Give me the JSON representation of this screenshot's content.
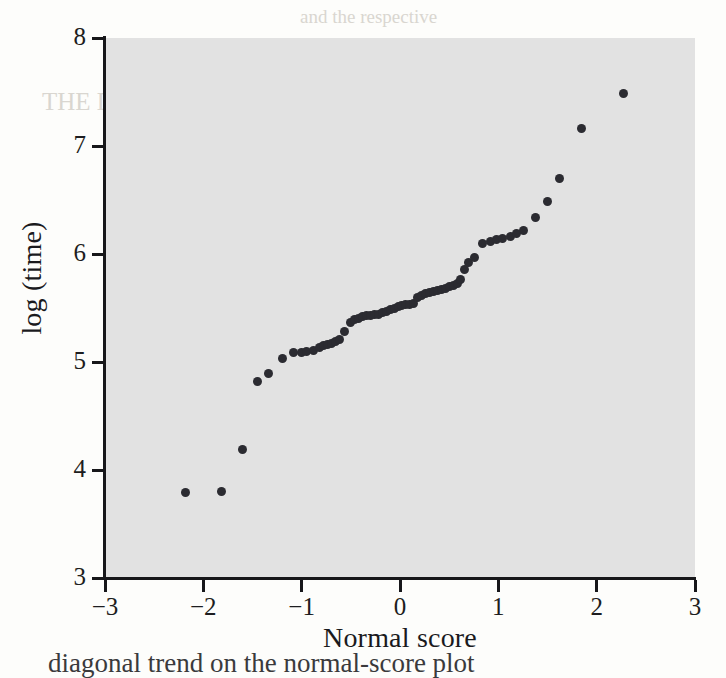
{
  "figure": {
    "xlabel": "Normal score",
    "ylabel": "log (time)",
    "plot_background_color": "#e2e2e2",
    "page_background_color": "#fdfdfb",
    "marker_color": "#2b2b31",
    "axis_color": "#17171a"
  },
  "caption": "diagonal trend on the normal-score plot",
  "bleed_text": [
    {
      "text": "and the respective",
      "x": 300,
      "y": 6,
      "size": 19
    },
    {
      "text": "THE DATA",
      "x": 42,
      "y": 88,
      "size": 25
    },
    {
      "text": "be given by",
      "x": 300,
      "y": 116,
      "size": 19
    },
    {
      "text": "in the sample of",
      "x": 286,
      "y": 140,
      "size": 19
    },
    {
      "text": "normal score",
      "x": 300,
      "y": 164,
      "size": 19
    },
    {
      "text": "the value of",
      "x": 306,
      "y": 188,
      "size": 19
    },
    {
      "text": "expected",
      "x": 318,
      "y": 404,
      "size": 20
    },
    {
      "text": "more nearly",
      "x": 124,
      "y": 420,
      "size": 21
    },
    {
      "text": "lot and then",
      "x": 300,
      "y": 432,
      "size": 19
    },
    {
      "text": "the linearity",
      "x": 300,
      "y": 456,
      "size": 19
    },
    {
      "text": "value of the",
      "x": 306,
      "y": 480,
      "size": 19
    },
    {
      "text": "and this value",
      "x": 300,
      "y": 504,
      "size": 19
    },
    {
      "text": "the sample",
      "x": 304,
      "y": 528,
      "size": 19
    }
  ],
  "chart_data": {
    "type": "scatter",
    "title": "",
    "xlabel": "Normal score",
    "ylabel": "log (time)",
    "xlim": [
      -3,
      3
    ],
    "ylim": [
      3,
      8
    ],
    "xticks": [
      -3,
      -2,
      -1,
      0,
      1,
      2,
      3
    ],
    "xticklabels": [
      "−3",
      "−2",
      "−1",
      "0",
      "1",
      "2",
      "3"
    ],
    "yticks": [
      3,
      4,
      5,
      6,
      7,
      8
    ],
    "yticklabels": [
      "3",
      "4",
      "5",
      "6",
      "7",
      "8"
    ],
    "grid": false,
    "legend": null,
    "points": [
      [
        -2.18,
        3.79
      ],
      [
        -1.82,
        3.8
      ],
      [
        -1.6,
        4.19
      ],
      [
        -1.45,
        4.82
      ],
      [
        -1.34,
        4.89
      ],
      [
        -1.2,
        5.03
      ],
      [
        -1.08,
        5.09
      ],
      [
        -1.0,
        5.09
      ],
      [
        -0.95,
        5.1
      ],
      [
        -0.88,
        5.11
      ],
      [
        -0.82,
        5.13
      ],
      [
        -0.78,
        5.15
      ],
      [
        -0.74,
        5.16
      ],
      [
        -0.7,
        5.17
      ],
      [
        -0.66,
        5.19
      ],
      [
        -0.62,
        5.21
      ],
      [
        -0.56,
        5.28
      ],
      [
        -0.5,
        5.37
      ],
      [
        -0.46,
        5.39
      ],
      [
        -0.42,
        5.4
      ],
      [
        -0.38,
        5.42
      ],
      [
        -0.34,
        5.43
      ],
      [
        -0.3,
        5.43
      ],
      [
        -0.26,
        5.44
      ],
      [
        -0.22,
        5.44
      ],
      [
        -0.18,
        5.46
      ],
      [
        -0.14,
        5.47
      ],
      [
        -0.1,
        5.49
      ],
      [
        -0.06,
        5.5
      ],
      [
        -0.02,
        5.51
      ],
      [
        0.02,
        5.52
      ],
      [
        0.06,
        5.53
      ],
      [
        0.1,
        5.53
      ],
      [
        0.14,
        5.54
      ],
      [
        0.18,
        5.6
      ],
      [
        0.22,
        5.62
      ],
      [
        0.26,
        5.63
      ],
      [
        0.3,
        5.64
      ],
      [
        0.34,
        5.65
      ],
      [
        0.38,
        5.66
      ],
      [
        0.42,
        5.67
      ],
      [
        0.46,
        5.68
      ],
      [
        0.5,
        5.7
      ],
      [
        0.54,
        5.71
      ],
      [
        0.58,
        5.73
      ],
      [
        0.62,
        5.76
      ],
      [
        0.66,
        5.86
      ],
      [
        0.7,
        5.92
      ],
      [
        0.76,
        5.97
      ],
      [
        0.84,
        6.1
      ],
      [
        0.92,
        6.12
      ],
      [
        0.98,
        6.13
      ],
      [
        1.04,
        6.14
      ],
      [
        1.12,
        6.16
      ],
      [
        1.18,
        6.19
      ],
      [
        1.26,
        6.22
      ],
      [
        1.38,
        6.34
      ],
      [
        1.5,
        6.49
      ],
      [
        1.62,
        6.7
      ],
      [
        1.85,
        7.16
      ],
      [
        2.27,
        7.49
      ]
    ]
  }
}
